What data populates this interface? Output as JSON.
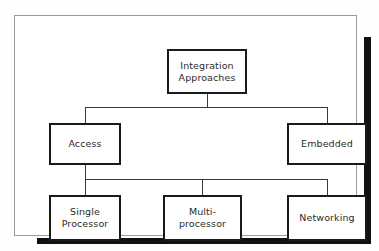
{
  "figure": {
    "type": "hierarchy-tree-diagram",
    "panel": {
      "background_color": "#ffffff",
      "border_color": "#9a9a9a",
      "shadow_color": "#111111"
    },
    "node_style": {
      "border_color": "#1a1a1a",
      "fill_color": "#ffffff",
      "text_color": "#2b2b2b"
    },
    "connector_color": "#3a3a3a"
  },
  "nodes": {
    "root": {
      "id": "integration-approaches",
      "label": "Integration\nApproaches",
      "level": 0
    },
    "level1": [
      {
        "id": "access",
        "label": "Access",
        "level": 1
      },
      {
        "id": "embedded",
        "label": "Embedded",
        "level": 1
      }
    ],
    "level2": [
      {
        "id": "single-processor",
        "label": "Single\nProcessor",
        "level": 2,
        "parent": "access"
      },
      {
        "id": "multiprocessor",
        "label": "Multi-\nprocessor",
        "level": 2,
        "parent": "access"
      },
      {
        "id": "networking",
        "label": "Networking",
        "level": 2,
        "parent": "access"
      }
    ]
  },
  "edges": [
    {
      "from": "integration-approaches",
      "to": "access"
    },
    {
      "from": "integration-approaches",
      "to": "embedded"
    },
    {
      "from": "access",
      "to": "single-processor"
    },
    {
      "from": "access",
      "to": "multiprocessor"
    },
    {
      "from": "access",
      "to": "networking"
    }
  ]
}
